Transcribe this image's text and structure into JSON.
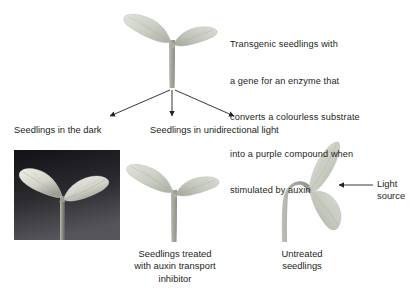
{
  "figure": {
    "title_note": "Transgenic seedling phototropism and auxin diagram",
    "background_color": "#ffffff",
    "line_color": "#231f20"
  },
  "description_block": {
    "lines": [
      "Transgenic seedlings with",
      "a gene for an enzyme that",
      "converts a colourless substrate",
      "into a purple compound when",
      "stimulated by auxin"
    ]
  },
  "branch_labels": {
    "dark": "Seedlings in the dark",
    "unidirectional": "Seedlings in unidirectional light"
  },
  "panel_captions": {
    "treated": "Seedlings treated\nwith auxin transport\ninhibitor",
    "untreated": "Untreated\nseedlings",
    "light_source": "Light\nsource"
  },
  "arrows": {
    "branch_count": 3,
    "light_arrow_direction": "left"
  },
  "seedlings": [
    {
      "id": "top-seedling",
      "name": "transgenic-seedling-upright",
      "posture": "upright",
      "leaf_count": 2,
      "stem_color": "#a8aca0",
      "leaf_color": "#c9cdc2"
    },
    {
      "id": "dark-photo-seedling",
      "name": "seedling-in-dark-photograph",
      "posture": "upright",
      "leaf_count": 2,
      "background": "dark photograph panel",
      "panel_color_top": "#16161a",
      "panel_color_bottom": "#4a4a4e",
      "leaf_color": "#d8d8cf"
    },
    {
      "id": "middle-seedling",
      "name": "auxin-transport-inhibitor-seedling",
      "posture": "upright",
      "leaf_count": 2,
      "stem_color": "#a8aca0",
      "leaf_color": "#c9cdc2"
    },
    {
      "id": "right-seedling",
      "name": "untreated-bending-seedling",
      "posture": "bent toward light",
      "leaf_count": 2,
      "stem_color": "#a3a79b",
      "leaf_color": "#c2c6bb"
    }
  ]
}
